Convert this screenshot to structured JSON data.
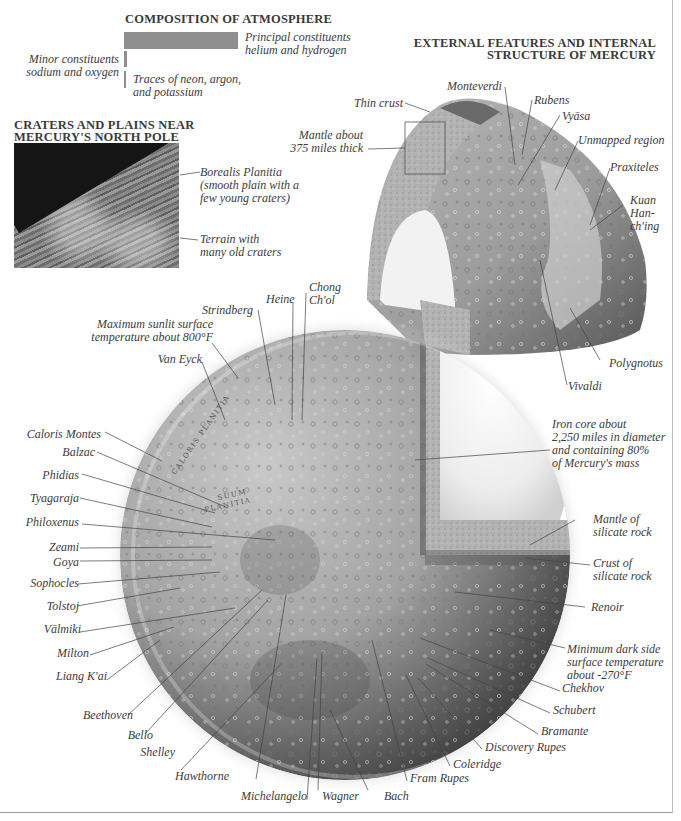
{
  "atmosphere": {
    "title": "COMPOSITION OF ATMOSPHERE",
    "principal_line1": "Principal constituents",
    "principal_line2": "helium and hydrogen",
    "minor_line1": "Minor constituents",
    "minor_line2": "sodium and oxygen",
    "traces_line1": "Traces of neon, argon,",
    "traces_line2": "and potassium",
    "bar_color": "#8f8f8f"
  },
  "north_pole": {
    "title_line1": "CRATERS AND PLAINS NEAR",
    "title_line2": "MERCURY'S NORTH POLE",
    "borealis_line1": "Borealis Planitia",
    "borealis_line2": "(smooth plain with a",
    "borealis_line3": "few young craters)",
    "terrain_line1": "Terrain with",
    "terrain_line2": "many old craters"
  },
  "external": {
    "title_line1": "EXTERNAL FEATURES AND INTERNAL",
    "title_line2": "STRUCTURE OF MERCURY",
    "thin_crust": "Thin crust",
    "mantle_line1": "Mantle about",
    "mantle_line2": "375 miles thick",
    "monteverdi": "Monteverdi",
    "rubens": "Rubens",
    "vyasa": "Vyāsa",
    "unmapped": "Unmapped region",
    "praxiteles": "Praxiteles",
    "kuan_line1": "Kuan",
    "kuan_line2": "Han-",
    "kuan_line3": "ch'ing",
    "polygnotus": "Polygnotus",
    "vivaldi": "Vivaldi"
  },
  "globe": {
    "max_temp_line1": "Maximum sunlit surface",
    "max_temp_line2": "temperature about 800°F",
    "strindberg": "Strindberg",
    "heine": "Heine",
    "chong_line1": "Chong",
    "chong_line2": "Ch'ol",
    "van_eyck": "Van Eyck",
    "left_labels": [
      "Caloris Montes",
      "Balzac",
      "Phidias",
      "Tyagaraja",
      "Philoxenus",
      "Zeami",
      "Goya",
      "Sophocles",
      "Tolstoj",
      "Vālmiki",
      "Milton",
      "Liang K'ai"
    ],
    "bottom_labels": [
      "Beethoven",
      "Bello",
      "Shelley",
      "Hawthorne",
      "Michelangelo",
      "Wagner",
      "Bach",
      "Fram Rupes",
      "Coleridge",
      "Discovery Rupes",
      "Bramante",
      "Schubert",
      "Chekhov"
    ],
    "iron_core_line1": "Iron core about",
    "iron_core_line2": "2,250 miles in diameter",
    "iron_core_line3": "and containing 80%",
    "iron_core_line4": "of Mercury's mass",
    "mantle_line1": "Mantle of",
    "mantle_line2": "silicate rock",
    "crust_line1": "Crust of",
    "crust_line2": "silicate rock",
    "renoir": "Renoir",
    "min_temp_line1": "Minimum dark side",
    "min_temp_line2": "surface temperature",
    "min_temp_line3": "about -270°F",
    "surface_text_1": "CALORIS PLANITIA",
    "surface_text_2": "SUUM PLANITIA"
  }
}
